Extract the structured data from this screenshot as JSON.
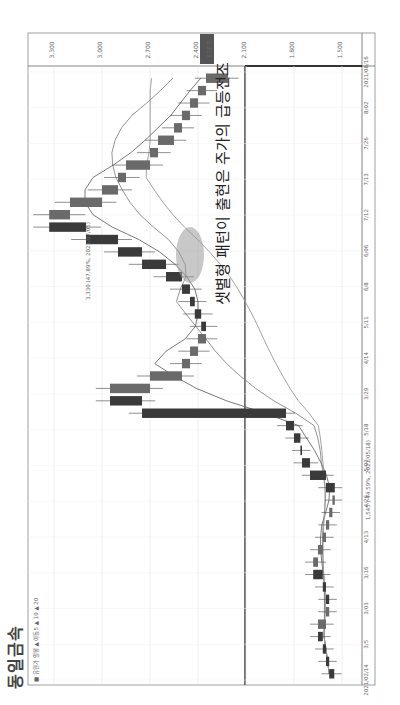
{
  "page": {
    "title": "동일금속",
    "legend_caption": "■ 유원가 일봉 ▲ 이동5 ▲ 10 ▲ 20"
  },
  "annotation": {
    "text": "샛별형 패턴이 출현은 주가의 급등전조",
    "highlight": "circled morning-star pattern"
  },
  "chart_data": {
    "type": "candlestick",
    "orientation": "rotated 90° counter-clockwise (time runs bottom→top, price increases right→left)",
    "ylabel": "Price (KRW)",
    "y_ticks": [
      3300,
      3000,
      2700,
      2400,
      2100,
      1800,
      1500
    ],
    "y_tick_labels": [
      "3,300",
      "3,000",
      "2,700",
      "2,400",
      "2,100",
      "1,800",
      "1,500"
    ],
    "ylim": [
      1400,
      3400
    ],
    "x_tick_labels": [
      "2021/02/14",
      "3/5",
      "3/03",
      "3/16",
      "4/13",
      "4/26",
      "5/03",
      "5/18",
      "3/29",
      "4/14",
      "5/11",
      "6/8",
      "6/06",
      "7/12",
      "7/13",
      "7/26",
      "8/02",
      "2021/08/16"
    ],
    "current_price_label": "2,213",
    "high_marker": "3,330 (47.89%, 2021/07/05)",
    "low_marker": "1,545 (-44.59%, 2021/05/18)",
    "series": [
      {
        "name": "close (approx)",
        "values": [
          1580,
          1600,
          1620,
          1650,
          1600,
          1580,
          1600,
          1620,
          1680,
          1650,
          1620,
          1600,
          1580,
          1560,
          1545,
          1600,
          1700,
          1750,
          1760,
          1800,
          1850,
          2750,
          2950,
          2700,
          2500,
          2450,
          2400,
          2350,
          2380,
          2420,
          2450,
          2500,
          2600,
          2750,
          2900,
          3100,
          3330,
          3200,
          3000,
          2900,
          2850,
          2700,
          2650,
          2550,
          2500,
          2450,
          2400,
          2350,
          2213
        ]
      },
      {
        "name": "MA5",
        "values": []
      },
      {
        "name": "MA10",
        "values": []
      },
      {
        "name": "MA20",
        "values": []
      }
    ],
    "grid": true,
    "legend_position": "bottom-left (rotated)"
  }
}
